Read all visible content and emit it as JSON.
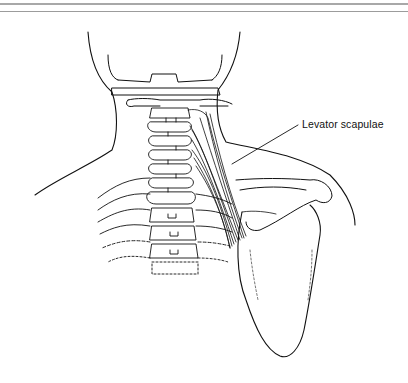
{
  "figure": {
    "type": "anatomical-illustration",
    "view": "posterior neck and shoulder",
    "labels": [
      {
        "id": "levator-scapulae",
        "text": "Levator scapulae"
      }
    ]
  },
  "colors": {
    "line": "#111111",
    "background": "#ffffff",
    "rule": "#a8a8a8"
  }
}
